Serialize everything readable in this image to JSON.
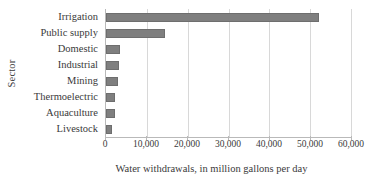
{
  "chart_data": {
    "type": "bar",
    "orientation": "horizontal",
    "title": "",
    "xlabel": "Water withdrawals, in million gallons per day",
    "ylabel": "Sector",
    "categories": [
      "Irrigation",
      "Public supply",
      "Domestic",
      "Industrial",
      "Mining",
      "Thermoelectric",
      "Aquaculture",
      "Livestock"
    ],
    "values": [
      52200,
      14450,
      3550,
      3200,
      2900,
      2200,
      2200,
      1400
    ],
    "xlim": [
      0,
      60000
    ],
    "xticks": [
      0,
      10000,
      20000,
      30000,
      40000,
      50000,
      60000
    ],
    "xtick_labels": [
      "0",
      "10,000",
      "20,000",
      "30,000",
      "40,000",
      "50,000",
      "60,000"
    ],
    "grid": "vertical",
    "legend": "none",
    "bar_color": "#7f7f7f",
    "gridline_color": "#d8d8d8",
    "axis_color": "#b9b9b9",
    "text_color": "#3a3a3a"
  }
}
